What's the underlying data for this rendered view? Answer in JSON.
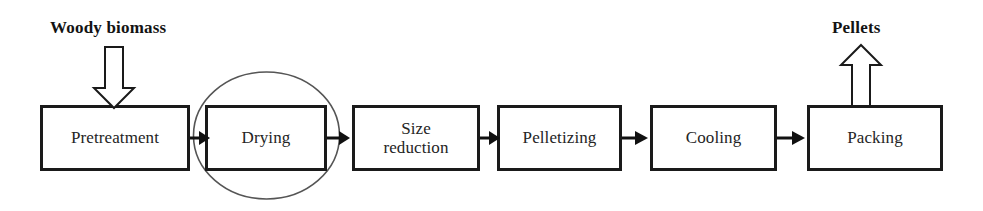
{
  "diagram": {
    "colors": {
      "box_border": "#1a1a1a",
      "box_fill": "#ffffff",
      "text": "#242424",
      "label_text": "#131313",
      "ellipse_stroke": "#555555",
      "arrow": "#111111",
      "background": "#ffffff"
    },
    "inputs": [
      {
        "name": "woody-biomass",
        "label": "Woody biomass",
        "direction": "down",
        "target": "Pretreatment"
      }
    ],
    "outputs": [
      {
        "name": "pellets",
        "label": "Pellets",
        "direction": "up",
        "source": "Packing"
      }
    ],
    "steps": [
      {
        "id": "pretreatment",
        "label": "Pretreatment",
        "x": 40,
        "width": 150,
        "highlighted": false
      },
      {
        "id": "drying",
        "label": "Drying",
        "x": 205,
        "width": 122,
        "highlighted": true
      },
      {
        "id": "size-reduction",
        "label": "Size\nreduction",
        "x": 352,
        "width": 128,
        "highlighted": false
      },
      {
        "id": "pelletizing",
        "label": "Pelletizing",
        "x": 497,
        "width": 125,
        "highlighted": false
      },
      {
        "id": "cooling",
        "label": "Cooling",
        "x": 650,
        "width": 127,
        "highlighted": false
      },
      {
        "id": "packing",
        "label": "Packing",
        "x": 807,
        "width": 136,
        "highlighted": false
      }
    ],
    "connectors": [
      {
        "from": "pretreatment",
        "to": "drying"
      },
      {
        "from": "drying",
        "to": "size-reduction"
      },
      {
        "from": "size-reduction",
        "to": "pelletizing"
      },
      {
        "from": "pelletizing",
        "to": "cooling"
      },
      {
        "from": "cooling",
        "to": "packing"
      }
    ],
    "highlight_marker": {
      "shape": "ellipse",
      "around": "drying"
    }
  }
}
